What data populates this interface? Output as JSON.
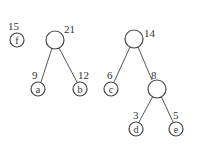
{
  "diagram": {
    "type": "huffman-forest",
    "trees": [
      {
        "id": "tree-f",
        "root": {
          "weight": "15",
          "label": "f",
          "leaf": true
        }
      },
      {
        "id": "tree-21",
        "root": {
          "weight": "21",
          "label": "",
          "leaf": false
        },
        "children": [
          {
            "weight": "9",
            "label": "a",
            "leaf": true
          },
          {
            "weight": "12",
            "label": "b",
            "leaf": true
          }
        ]
      },
      {
        "id": "tree-14",
        "root": {
          "weight": "14",
          "label": "",
          "leaf": false
        },
        "children": [
          {
            "weight": "6",
            "label": "c",
            "leaf": true
          },
          {
            "weight": "8",
            "label": "",
            "leaf": false,
            "children": [
              {
                "weight": "3",
                "label": "d",
                "leaf": true
              },
              {
                "weight": "5",
                "label": "e",
                "leaf": true
              }
            ]
          }
        ]
      }
    ]
  },
  "nodes": {
    "f": {
      "weight": "15",
      "label": "f"
    },
    "n21": {
      "weight": "21"
    },
    "a": {
      "weight": "9",
      "label": "a"
    },
    "b": {
      "weight": "12",
      "label": "b"
    },
    "n14": {
      "weight": "14"
    },
    "c": {
      "weight": "6",
      "label": "c"
    },
    "n8": {
      "weight": "8"
    },
    "d": {
      "weight": "3",
      "label": "d"
    },
    "e": {
      "weight": "5",
      "label": "e"
    }
  },
  "colors": {
    "stroke": "#444444",
    "text": "#333333",
    "background": "#ffffff"
  }
}
